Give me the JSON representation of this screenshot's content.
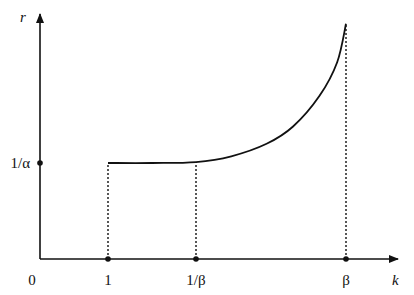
{
  "chart_data": {
    "type": "line",
    "title": "",
    "xlabel": "k",
    "ylabel": "r",
    "x_ticks": [
      {
        "label": "0",
        "value": 0
      },
      {
        "label": "1",
        "value": 1
      },
      {
        "label": "1/β",
        "value": 2
      },
      {
        "label": "β",
        "value": 3.7
      }
    ],
    "y_ticks": [
      {
        "label": "1/α",
        "value": 1
      }
    ],
    "xlim": [
      0,
      4.1
    ],
    "ylim": [
      0,
      2.55
    ],
    "series": [
      {
        "name": "r(k)",
        "style": "solid",
        "description": "flat at 1/α from k=1 to k=1/β, then increasing convexly up to k=β",
        "x": [
          1,
          1.5,
          2,
          2.4,
          2.8,
          3.1,
          3.4,
          3.6,
          3.7
        ],
        "y": [
          1,
          1.0,
          1.01,
          1.07,
          1.2,
          1.38,
          1.7,
          2.05,
          2.45
        ]
      }
    ],
    "reference_lines": [
      {
        "type": "vertical-dotted",
        "at_x": 1,
        "from_y": 0,
        "to_y": 1
      },
      {
        "type": "vertical-dotted",
        "at_x": 2,
        "from_y": 0,
        "to_y": 1.01
      },
      {
        "type": "vertical-dotted",
        "at_x": 3.7,
        "from_y": 0,
        "to_y": 2.45
      }
    ],
    "grid": false,
    "legend": "none"
  }
}
